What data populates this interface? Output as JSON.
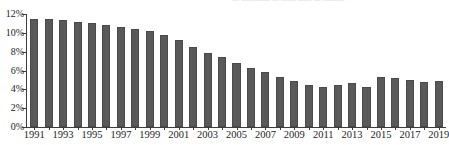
{
  "top_caption": {
    "text": "— ————  — —— —— —  ———",
    "note_visible": "partially cropped caption row at top edge"
  },
  "chart_data": {
    "type": "bar",
    "title": "",
    "xlabel": "",
    "ylabel": "",
    "ylim": [
      0,
      12
    ],
    "ytick_values": [
      0,
      2,
      4,
      6,
      8,
      10,
      12
    ],
    "ytick_labels": [
      "0%",
      "2%",
      "4%",
      "6%",
      "8%",
      "10%",
      "12%"
    ],
    "grid": false,
    "legend": null,
    "xtick_label_interval": 2,
    "categories": [
      "1991",
      "1992",
      "1993",
      "1994",
      "1995",
      "1996",
      "1997",
      "1998",
      "1999",
      "2000",
      "2001",
      "2002",
      "2003",
      "2004",
      "2005",
      "2006",
      "2007",
      "2008",
      "2009",
      "2010",
      "2011",
      "2012",
      "2013",
      "2014",
      "2015",
      "2016",
      "2017",
      "2018",
      "2019"
    ],
    "xtick_labels": [
      "1991",
      "",
      "1993",
      "",
      "1995",
      "",
      "1997",
      "",
      "1999",
      "",
      "2001",
      "",
      "2003",
      "",
      "2005",
      "",
      "2007",
      "",
      "2009",
      "",
      "2011",
      "",
      "2013",
      "",
      "2015",
      "",
      "2017",
      "",
      "2019"
    ],
    "values": [
      11.5,
      11.5,
      11.4,
      11.2,
      11.0,
      10.8,
      10.6,
      10.4,
      10.2,
      9.8,
      9.2,
      8.5,
      7.9,
      7.4,
      6.8,
      6.3,
      5.8,
      5.35,
      4.85,
      4.5,
      4.3,
      4.5,
      4.65,
      4.25,
      5.3,
      5.25,
      4.95,
      4.8,
      4.9
    ],
    "bar_color": "#595959",
    "bar_edge_color": "#4a4a4a",
    "axis_color": "#3c3c3c",
    "text_color": "#1d1d1d",
    "background_color": "#ffffff"
  }
}
